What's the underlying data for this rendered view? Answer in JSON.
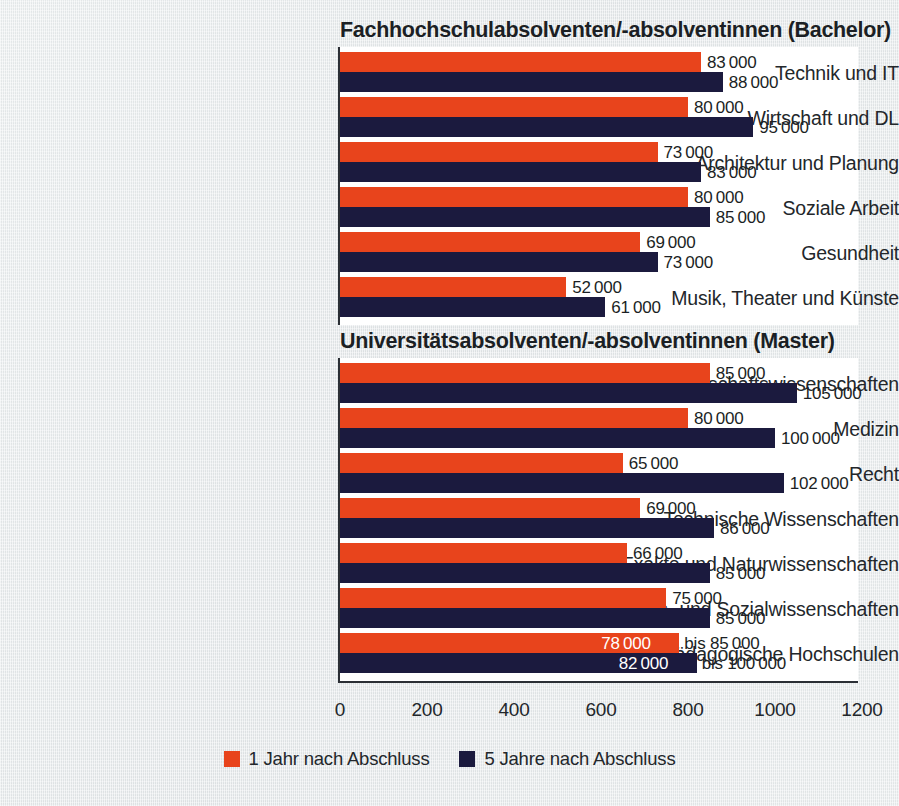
{
  "chart_data": [
    {
      "type": "bar",
      "orientation": "horizontal",
      "title": "Fachhochschulabsolventen/-absolventinnen (Bachelor)",
      "xlabel": "",
      "ylabel": "",
      "xlim": [
        0,
        1200
      ],
      "xticks": [
        "0",
        "200",
        "400",
        "600",
        "800",
        "1000",
        "1200"
      ],
      "grid": false,
      "legend_position": "bottom-center",
      "categories": [
        "Technik und IT",
        "Wirtschaft und DL",
        "Architektur und Planung",
        "Soziale Arbeit",
        "Gesundheit",
        "Musik, Theater und Künste"
      ],
      "series": [
        {
          "name": "1 Jahr nach Abschluss",
          "color": "#e8441c",
          "values": [
            830,
            800,
            730,
            800,
            690,
            520
          ],
          "labels": [
            "83 000",
            "80 000",
            "73 000",
            "80 000",
            "69 000",
            "52 000"
          ]
        },
        {
          "name": "5 Jahre nach Abschluss",
          "color": "#1b1a3e",
          "values": [
            880,
            950,
            830,
            850,
            730,
            610
          ],
          "labels": [
            "88 000",
            "95 000",
            "83 000",
            "85 000",
            "73 000",
            "61 000"
          ]
        }
      ]
    },
    {
      "type": "bar",
      "orientation": "horizontal",
      "title": "Universitätsabsolventen/-absolventinnen (Master)",
      "xlabel": "",
      "ylabel": "",
      "xlim": [
        0,
        1200
      ],
      "xticks": [
        "0",
        "200",
        "400",
        "600",
        "800",
        "1000",
        "1200"
      ],
      "grid": false,
      "legend_position": "bottom-center",
      "categories": [
        "Wirtschaftswissenschaften",
        "Medizin",
        "Recht",
        "Technische Wissenschaften",
        "Exakte und Naturwissenschaften",
        "Geistes- und Sozialwissenschaften",
        "Pädagogische Hochschulen"
      ],
      "series": [
        {
          "name": "1 Jahr nach Abschluss",
          "color": "#e8441c",
          "values": [
            850,
            800,
            650,
            690,
            660,
            750,
            780
          ],
          "labels": [
            "85 000",
            "80 000",
            "65 000",
            "69 000",
            "66 000",
            "75 000",
            "78 000"
          ],
          "label_suffixes": [
            "",
            "",
            "",
            "",
            "",
            "",
            "bis 85 000"
          ],
          "label_inside": [
            false,
            false,
            false,
            false,
            false,
            false,
            true
          ]
        },
        {
          "name": "5 Jahre nach Abschluss",
          "color": "#1b1a3e",
          "values": [
            1050,
            1000,
            1020,
            860,
            850,
            850,
            820
          ],
          "labels": [
            "105 000",
            "100 000",
            "102 000",
            "86 000",
            "85 000",
            "85 000",
            "82 000"
          ],
          "label_suffixes": [
            "",
            "",
            "",
            "",
            "",
            "",
            "bis 100 000"
          ],
          "label_inside": [
            false,
            false,
            false,
            false,
            false,
            false,
            true
          ]
        }
      ]
    }
  ],
  "legend": {
    "items": [
      {
        "label": "1 Jahr nach Abschluss",
        "color": "#e8441c"
      },
      {
        "label": "5 Jahre nach Abschluss",
        "color": "#1b1a3e"
      }
    ]
  },
  "colors": {
    "background": "#e4e8e9",
    "panel": "#ffffff",
    "orange": "#e8441c",
    "navy": "#1b1a3e",
    "text": "#23272b"
  }
}
